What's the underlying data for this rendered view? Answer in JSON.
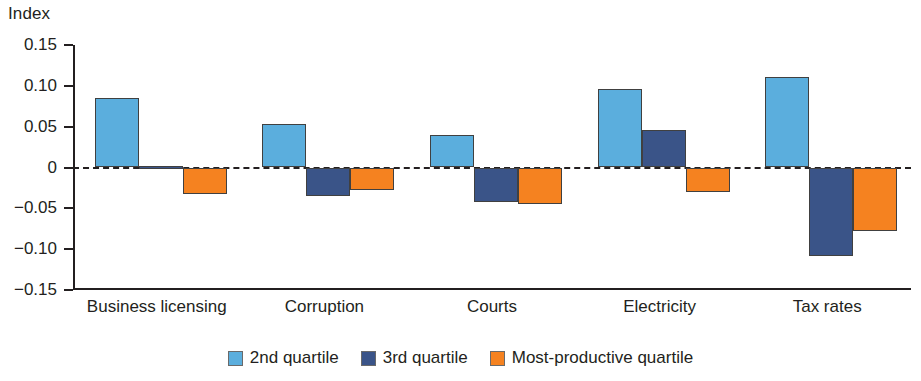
{
  "chart_data": {
    "type": "bar",
    "title": "",
    "ylabel": "Index",
    "xlabel": "",
    "ylim": [
      -0.15,
      0.15
    ],
    "ytick_labels": [
      "0.15",
      "0.10",
      "0.05",
      "0",
      "−0.05",
      "−0.10",
      "−0.15"
    ],
    "ytick_values": [
      0.15,
      0.1,
      0.05,
      0,
      -0.05,
      -0.1,
      -0.15
    ],
    "grid": false,
    "zero_line": true,
    "legend_position": "bottom",
    "categories": [
      "Business licensing",
      "Corruption",
      "Courts",
      "Electricity",
      "Tax rates"
    ],
    "series": [
      {
        "name": "2nd quartile",
        "color": "#5baedd",
        "values": [
          0.085,
          0.053,
          0.04,
          0.096,
          0.111
        ]
      },
      {
        "name": "3rd quartile",
        "color": "#3a5488",
        "values": [
          0.0,
          -0.035,
          -0.042,
          0.046,
          -0.108
        ]
      },
      {
        "name": "Most-productive quartile",
        "color": "#f58220",
        "values": [
          -0.033,
          -0.027,
          -0.045,
          -0.03,
          -0.078
        ]
      }
    ]
  }
}
